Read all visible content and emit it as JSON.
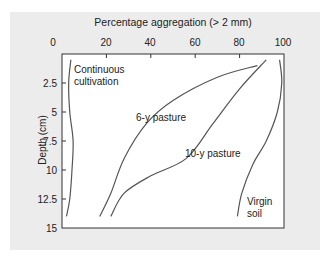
{
  "chart_data": {
    "type": "line",
    "title": "Percentage aggregation (> 2 mm)",
    "xlabel": "Percentage aggregation (> 2 mm)",
    "ylabel": "Depth (cm)",
    "xlim": [
      0,
      100
    ],
    "ylim": [
      15,
      0
    ],
    "x_axis_position": "top",
    "y_inverted": true,
    "grid": false,
    "x_ticks": [
      "0",
      "20",
      "40",
      "60",
      "80",
      "100"
    ],
    "y_ticks": [
      "2.5",
      "5",
      "7.5",
      "10",
      "12.5",
      "15"
    ],
    "series": [
      {
        "name": "Continuous cultivation",
        "points": [
          [
            4,
            0.5
          ],
          [
            3,
            2.5
          ],
          [
            3.5,
            5
          ],
          [
            5,
            7.5
          ],
          [
            4.5,
            10
          ],
          [
            3.5,
            12.5
          ],
          [
            2,
            14
          ]
        ]
      },
      {
        "name": "6-y pasture",
        "points": [
          [
            88,
            1
          ],
          [
            70,
            2
          ],
          [
            50,
            4
          ],
          [
            38,
            6
          ],
          [
            28,
            9
          ],
          [
            22,
            12
          ],
          [
            17,
            14
          ]
        ]
      },
      {
        "name": "10-y pasture",
        "points": [
          [
            92,
            0.5
          ],
          [
            80,
            3
          ],
          [
            68,
            6
          ],
          [
            56,
            9
          ],
          [
            40,
            10.5
          ],
          [
            28,
            12
          ],
          [
            22,
            14
          ]
        ]
      },
      {
        "name": "Virgin soil",
        "points": [
          [
            98,
            0.5
          ],
          [
            99,
            2.5
          ],
          [
            97,
            5
          ],
          [
            92,
            7.5
          ],
          [
            86,
            9.5
          ],
          [
            81,
            12
          ],
          [
            79,
            14
          ]
        ]
      }
    ],
    "annotations": [
      {
        "text": "Continuous cultivation",
        "series": "Continuous cultivation"
      },
      {
        "text": "6-y pasture",
        "series": "6-y pasture"
      },
      {
        "text": "10-y pasture",
        "series": "10-y pasture"
      },
      {
        "text": "Virgin soil",
        "series": "Virgin soil"
      }
    ],
    "legend": "none (inline labels)"
  },
  "labels": {
    "title": "Percentage aggregation (> 2 mm)",
    "ylabel": "Depth (cm)",
    "x_ticks": [
      "0",
      "20",
      "40",
      "60",
      "80",
      "100"
    ],
    "y_ticks": [
      "2.5",
      "5",
      "7.5",
      "10",
      "12.5",
      "15"
    ],
    "cc_line1": "Continuous",
    "cc_line2": "cultivation",
    "p6": "6-y pasture",
    "p10": "10-y pasture",
    "vs_line1": "Virgin",
    "vs_line2": "soil"
  },
  "colors": {
    "panel": "#ececec",
    "plot": "#ffffff",
    "line": "#555555",
    "axis": "#333333"
  }
}
